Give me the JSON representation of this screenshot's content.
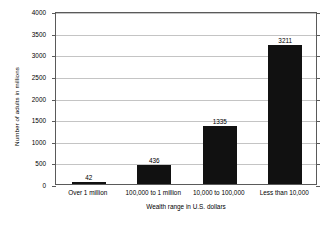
{
  "chart_data": {
    "type": "bar",
    "title": "",
    "subtitle": "",
    "categories": [
      "Over 1 million",
      "100,000 to 1 million",
      "10,000 to 100,000",
      "Less than 10,000"
    ],
    "values": [
      42,
      436,
      1335,
      3211
    ],
    "value_labels": [
      "42",
      "436",
      "1335",
      "3211"
    ],
    "xlabel": "Wealth range in U.S. dollars",
    "ylabel": "Number of adults in millions",
    "ylim": [
      0,
      4000
    ],
    "ytick_labels": [
      "0",
      "500",
      "1000",
      "1500",
      "2000",
      "2500",
      "3000",
      "3500",
      "4000"
    ],
    "ytick_values": [
      0,
      500,
      1000,
      1500,
      2000,
      2500,
      3000,
      3500,
      4000
    ],
    "grid": true,
    "legend": false,
    "legend_position": "none",
    "bar_color": "#111111",
    "grid_color": "#c4c4c4",
    "axis_color": "#5a5a5a",
    "background_color": "#ffffff"
  }
}
